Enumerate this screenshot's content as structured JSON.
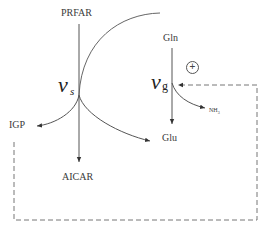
{
  "diagram": {
    "nodes": {
      "prfar": "PRFAR",
      "gln": "Gln",
      "igp": "IGP",
      "aicar": "AICAR",
      "glu": "Glu",
      "nh3": "NH",
      "nh3_sub": "3"
    },
    "rates": {
      "synthase": {
        "symbol": "v",
        "subscript": "s"
      },
      "glutaminase": {
        "symbol": "v",
        "subscript": "g"
      }
    },
    "regulation": {
      "sign": "+",
      "type": "positive feedback",
      "from": "IGP",
      "to": "v_g"
    },
    "colors": {
      "line": "#555555",
      "dashed": "#777777",
      "text": "#333333"
    }
  }
}
